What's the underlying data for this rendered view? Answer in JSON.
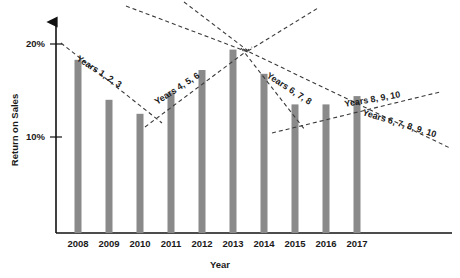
{
  "chart_data": {
    "type": "bar",
    "title": "",
    "subtitle": "",
    "xlabel": "Year",
    "ylabel": "Return on Sales",
    "categories": [
      "2008",
      "2009",
      "2010",
      "2011",
      "2012",
      "2013",
      "2014",
      "2015",
      "2016",
      "2017"
    ],
    "values": [
      18.3,
      14.0,
      12.5,
      14.8,
      17.2,
      19.4,
      16.8,
      13.5,
      13.5,
      14.4
    ],
    "ylim": [
      0,
      21
    ],
    "ytick_values": [
      10,
      20
    ],
    "ytick_labels": [
      "10%",
      "20%"
    ],
    "grid": false,
    "legend": "none",
    "bar_color": "#8a8a8a",
    "axis_color": "#111111",
    "trend_color": "#3a3a3a",
    "annotations": [
      {
        "label": "Years 1, 2, 3",
        "from_category": "2008",
        "to_category": "2010",
        "from_value": 18.3,
        "to_value": 12.5,
        "direction": "declining",
        "label_x": 76,
        "label_y": 60,
        "label_rotation": 33,
        "x1": 61,
        "y1": 43,
        "x2": 162,
        "y2": 123
      },
      {
        "label": "Years 4, 5, 6",
        "from_category": "2010",
        "to_category": "2013",
        "from_value": 12.5,
        "to_value": 19.4,
        "direction": "rising",
        "label_x": 157,
        "label_y": 105,
        "label_rotation": -33,
        "x1": 145,
        "y1": 127,
        "x2": 252,
        "y2": 47
      },
      {
        "label": "Years 6, 7, 8",
        "from_category": "2013",
        "to_category": "2015",
        "from_value": 19.4,
        "to_value": 13.5,
        "direction": "declining",
        "label_x": 266,
        "label_y": 77,
        "label_rotation": 33,
        "x1": 241,
        "y1": 48,
        "x2": 305,
        "y2": 130
      },
      {
        "label": "Years 8, 9, 10",
        "from_category": "2015",
        "to_category": "2017",
        "from_value": 13.5,
        "to_value": 14.4,
        "direction": "rising",
        "label_x": 345,
        "label_y": 107,
        "label_rotation": -10,
        "x1": 272,
        "y1": 133,
        "x2": 440,
        "y2": 92
      },
      {
        "label": "Years 6, 7, 8, 9, 10",
        "from_category": "2013",
        "to_category": "2017",
        "from_value": 19.4,
        "to_value": 14.4,
        "direction": "declining",
        "label_x": 362,
        "label_y": 115,
        "label_rotation": 17,
        "x1": 243,
        "y1": 49,
        "x2": 450,
        "y2": 148
      },
      {
        "label": "",
        "direction": "converge-left",
        "x1": 126,
        "y1": 6,
        "x2": 248,
        "y2": 52
      },
      {
        "label": "",
        "direction": "converge-top",
        "x1": 184,
        "y1": 2,
        "x2": 247,
        "y2": 50
      },
      {
        "label": "",
        "direction": "converge-right",
        "x1": 248,
        "y1": 51,
        "x2": 318,
        "y2": 8
      }
    ]
  },
  "axes": {
    "y_axis_name": "return-on-sales-axis",
    "x_axis_name": "year-axis"
  }
}
